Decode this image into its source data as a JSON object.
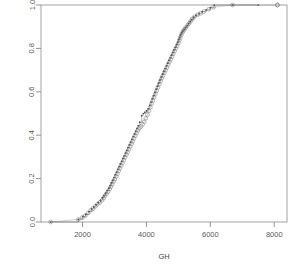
{
  "chart_data": {
    "type": "line",
    "title": "",
    "subtitle": "",
    "xlabel": "GH",
    "ylabel": "",
    "xlim": [
      700,
      8400
    ],
    "ylim": [
      0.0,
      1.0
    ],
    "grid": false,
    "legend": "none",
    "xticks": [
      2000,
      4000,
      6000,
      8000
    ],
    "xtick_labels": [
      "2000",
      "4000",
      "6000",
      "8000"
    ],
    "yticks": [
      0.0,
      0.2,
      0.4,
      0.6,
      0.8,
      1.0
    ],
    "ytick_labels": [
      "0.0",
      "0.2",
      "0.4",
      "0.6",
      "0.8",
      "1.0"
    ],
    "series": [
      {
        "name": "ecdf-open-circles",
        "marker": "open-circle",
        "color": "#888888",
        "x": [
          1000,
          1870,
          2000,
          2090,
          2180,
          2260,
          2330,
          2400,
          2470,
          2540,
          2610,
          2660,
          2700,
          2750,
          2800,
          2850,
          2890,
          2930,
          2970,
          3010,
          3050,
          3090,
          3130,
          3170,
          3210,
          3250,
          3290,
          3330,
          3370,
          3410,
          3450,
          3490,
          3530,
          3570,
          3610,
          3650,
          3690,
          3730,
          3780,
          3830,
          3880,
          3930,
          3980,
          4030,
          4080,
          4120,
          4160,
          4200,
          4240,
          4280,
          4320,
          4360,
          4400,
          4440,
          4480,
          4520,
          4560,
          4600,
          4640,
          4680,
          4720,
          4760,
          4800,
          4840,
          4880,
          4920,
          4960,
          5000,
          5030,
          5060,
          5090,
          5120,
          5150,
          5190,
          5230,
          5280,
          5330,
          5380,
          5430,
          5500,
          5600,
          5700,
          5800,
          5950,
          6100,
          6700,
          8100
        ],
        "y": [
          0.0,
          0.012,
          0.022,
          0.03,
          0.042,
          0.055,
          0.062,
          0.072,
          0.082,
          0.09,
          0.1,
          0.11,
          0.12,
          0.13,
          0.14,
          0.152,
          0.163,
          0.175,
          0.187,
          0.198,
          0.21,
          0.222,
          0.235,
          0.248,
          0.26,
          0.272,
          0.285,
          0.298,
          0.31,
          0.322,
          0.335,
          0.348,
          0.36,
          0.372,
          0.385,
          0.398,
          0.41,
          0.422,
          0.432,
          0.44,
          0.45,
          0.462,
          0.478,
          0.495,
          0.512,
          0.528,
          0.545,
          0.56,
          0.575,
          0.59,
          0.605,
          0.62,
          0.635,
          0.65,
          0.663,
          0.675,
          0.688,
          0.7,
          0.712,
          0.725,
          0.738,
          0.75,
          0.762,
          0.775,
          0.788,
          0.8,
          0.812,
          0.825,
          0.838,
          0.85,
          0.862,
          0.872,
          0.88,
          0.888,
          0.895,
          0.905,
          0.915,
          0.925,
          0.935,
          0.945,
          0.955,
          0.962,
          0.97,
          0.98,
          0.99,
          1.0,
          1.0
        ]
      },
      {
        "name": "ecdf-step-dots",
        "marker": "small-dot",
        "line": "step",
        "color": "#555555",
        "x": [
          1000,
          1870,
          2010,
          2100,
          2200,
          2280,
          2350,
          2420,
          2490,
          2560,
          2620,
          2670,
          2720,
          2770,
          2820,
          2860,
          2900,
          2940,
          2980,
          3020,
          3060,
          3100,
          3140,
          3180,
          3220,
          3260,
          3300,
          3340,
          3380,
          3420,
          3460,
          3500,
          3540,
          3580,
          3620,
          3660,
          3700,
          3740,
          3790,
          3850,
          3900,
          3950,
          4000,
          4050,
          4100,
          4140,
          4180,
          4220,
          4260,
          4300,
          4340,
          4380,
          4420,
          4460,
          4500,
          4540,
          4580,
          4620,
          4660,
          4700,
          4740,
          4780,
          4820,
          4860,
          4900,
          4940,
          4980,
          5010,
          5040,
          5070,
          5100,
          5140,
          5180,
          5220,
          5270,
          5320,
          5370,
          5420,
          5480,
          5550,
          5650,
          5750,
          5870,
          6000,
          6120,
          6700,
          7500
        ],
        "y": [
          0.0,
          0.012,
          0.025,
          0.035,
          0.048,
          0.06,
          0.07,
          0.08,
          0.09,
          0.1,
          0.112,
          0.122,
          0.133,
          0.145,
          0.156,
          0.168,
          0.18,
          0.192,
          0.205,
          0.218,
          0.23,
          0.243,
          0.255,
          0.268,
          0.28,
          0.293,
          0.305,
          0.318,
          0.33,
          0.343,
          0.356,
          0.368,
          0.381,
          0.394,
          0.406,
          0.419,
          0.432,
          0.444,
          0.46,
          0.49,
          0.5,
          0.505,
          0.512,
          0.522,
          0.538,
          0.553,
          0.568,
          0.582,
          0.597,
          0.612,
          0.626,
          0.64,
          0.654,
          0.668,
          0.681,
          0.694,
          0.707,
          0.72,
          0.732,
          0.745,
          0.757,
          0.769,
          0.781,
          0.793,
          0.805,
          0.817,
          0.828,
          0.84,
          0.851,
          0.862,
          0.872,
          0.88,
          0.888,
          0.896,
          0.905,
          0.915,
          0.925,
          0.934,
          0.944,
          0.953,
          0.962,
          0.97,
          0.978,
          0.988,
          1.0,
          1.0,
          1.0
        ]
      }
    ],
    "annotations": [
      {
        "name": "isolated-right-point",
        "x": 8100,
        "y": 1.0
      }
    ]
  }
}
